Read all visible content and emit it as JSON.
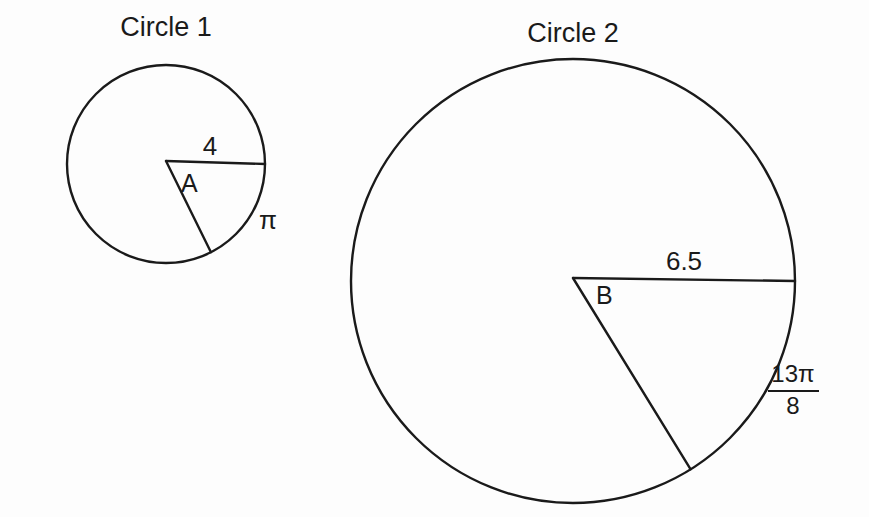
{
  "canvas": {
    "width": 869,
    "height": 517,
    "background": "#fdfdfd",
    "ink_color": "#1a1a1a"
  },
  "figure": {
    "kind": "two-circle-sector-geometry-diagram",
    "circles": [
      {
        "id": "circle-1",
        "title": "Circle 1",
        "title_x": 166,
        "title_y": 36,
        "center_x": 166,
        "center_y": 164,
        "radius": 99,
        "stroke_width": 2.4,
        "radius_label": "4",
        "radius_label_x": 210,
        "radius_label_y": 155,
        "vertex_label": "A",
        "vertex_label_x": 181,
        "vertex_label_y": 192,
        "arc_label": "π",
        "arc_label_x": 259,
        "arc_label_y": 229,
        "arc_label_is_fraction": false,
        "spoke_a_angle_deg": 0,
        "spoke_b_angle_deg": 63
      },
      {
        "id": "circle-2",
        "title": "Circle 2",
        "title_x": 573,
        "title_y": 42,
        "center_x": 573,
        "center_y": 281,
        "radius": 222,
        "stroke_width": 2.4,
        "radius_label": "6.5",
        "radius_label_x": 684,
        "radius_label_y": 270,
        "vertex_label": "B",
        "vertex_label_x": 596,
        "vertex_label_y": 304,
        "arc_label_is_fraction": true,
        "arc_label_numerator": "13π",
        "arc_label_denominator": "8",
        "arc_label_x": 793,
        "arc_label_y": 380,
        "spoke_a_angle_deg": 0,
        "spoke_b_angle_deg": 58
      }
    ]
  },
  "labels": {
    "circle1_title": "Circle 1",
    "circle1_radius": "4",
    "circle1_angle": "A",
    "circle1_arc": "π",
    "circle2_title": "Circle 2",
    "circle2_radius": "6.5",
    "circle2_angle": "B",
    "circle2_arc_numerator": "13π",
    "circle2_arc_denominator": "8"
  }
}
